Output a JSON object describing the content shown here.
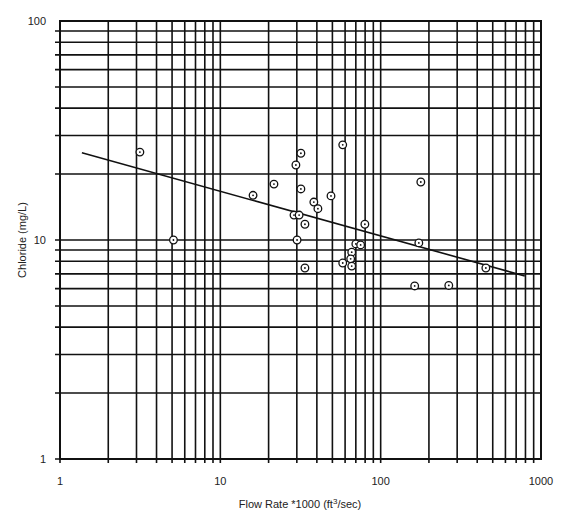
{
  "chart_data": {
    "type": "scatter",
    "title": "",
    "xlabel": "Flow Rate *1000 (ft³/sec)",
    "xlabel_parts": {
      "before": "Flow Rate *1000 (ft",
      "sup": "3",
      "after": "/sec)"
    },
    "ylabel": "Chloride (mg/L)",
    "xscale": "log",
    "yscale": "log",
    "xlim": [
      1,
      1000
    ],
    "ylim": [
      1,
      100
    ],
    "grid": true,
    "x_ticks": [
      1,
      10,
      100,
      1000
    ],
    "x_tick_labels": [
      "1",
      "10",
      "100",
      "1000"
    ],
    "y_ticks": [
      1,
      10,
      100
    ],
    "y_tick_labels": [
      "1",
      "10",
      "100"
    ],
    "series": [
      {
        "name": "observations",
        "marker": "circle-dot",
        "points": [
          {
            "x": 3.15,
            "y": 25.2
          },
          {
            "x": 5.1,
            "y": 10.0
          },
          {
            "x": 16.0,
            "y": 16.0
          },
          {
            "x": 21.6,
            "y": 18.0
          },
          {
            "x": 58,
            "y": 27.2
          },
          {
            "x": 31.8,
            "y": 24.9
          },
          {
            "x": 29.6,
            "y": 22.0
          },
          {
            "x": 31.8,
            "y": 17.1
          },
          {
            "x": 49,
            "y": 15.9
          },
          {
            "x": 38.3,
            "y": 14.9
          },
          {
            "x": 40.6,
            "y": 13.9
          },
          {
            "x": 28.8,
            "y": 13.0
          },
          {
            "x": 31.0,
            "y": 13.0
          },
          {
            "x": 33.7,
            "y": 11.8
          },
          {
            "x": 79.7,
            "y": 11.8
          },
          {
            "x": 30.1,
            "y": 10.0
          },
          {
            "x": 70,
            "y": 9.6
          },
          {
            "x": 75,
            "y": 9.5
          },
          {
            "x": 66,
            "y": 8.8
          },
          {
            "x": 58,
            "y": 7.85
          },
          {
            "x": 65,
            "y": 8.2
          },
          {
            "x": 66,
            "y": 7.6
          },
          {
            "x": 33.7,
            "y": 7.45
          },
          {
            "x": 178,
            "y": 18.4
          },
          {
            "x": 173,
            "y": 9.7
          },
          {
            "x": 453,
            "y": 7.45
          },
          {
            "x": 163,
            "y": 6.17
          },
          {
            "x": 266,
            "y": 6.2
          }
        ]
      }
    ],
    "trend_line": {
      "x": [
        1.37,
        792
      ],
      "y": [
        25.0,
        6.85
      ]
    }
  }
}
